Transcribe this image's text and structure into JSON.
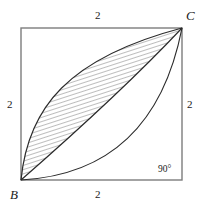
{
  "figure": {
    "shape": "square",
    "vertices": {
      "bottom_left": {
        "name": "B",
        "label": "B"
      },
      "top_right": {
        "name": "C",
        "label": "C"
      }
    },
    "side_labels": {
      "top": "2",
      "left": "2",
      "right": "2",
      "bottom": "2"
    },
    "angle_label": "90°",
    "colors": {
      "square_stroke": "#7d7d7d",
      "arc_stroke": "#2b2b2b",
      "hatch_stroke": "#5a5a5a",
      "label_text": "#1a1a1a",
      "background": "#ffffff"
    },
    "geometry": {
      "square": {
        "x": 21,
        "y": 28,
        "width": 161,
        "height": 152
      },
      "arcs": [
        {
          "name": "upper-arc",
          "from": "B",
          "to": "C",
          "bulge": "toward-top-left"
        },
        {
          "name": "middle-arc",
          "from": "B",
          "to": "C",
          "bulge": "slight-top-left"
        },
        {
          "name": "lower-arc",
          "from": "B",
          "to": "C",
          "bulge": "toward-bottom-right"
        }
      ],
      "hatched_region": {
        "name": "lens",
        "bounded_by": [
          "upper-arc",
          "middle-arc"
        ],
        "hatch_angle_degrees": 72
      }
    }
  }
}
